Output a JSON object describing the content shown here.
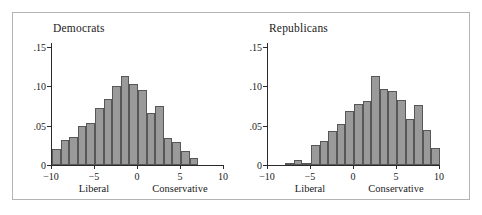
{
  "figure": {
    "background": "#ffffff",
    "frame_color": "#b4b4b4",
    "bar_fill": "#9a9a9a",
    "bar_edge": "#575757"
  },
  "chart_data": [
    {
      "type": "bar",
      "title": "Democrats",
      "xlabel": "",
      "ylabel": "",
      "xlim": [
        -10,
        10
      ],
      "ylim": [
        0,
        0.155
      ],
      "grid": false,
      "legend": "none",
      "xticks": [
        -10,
        -5,
        0,
        5,
        10
      ],
      "xtick_labels": [
        "−10",
        "−5",
        "0",
        "5",
        "10"
      ],
      "yticks": [
        0,
        0.05,
        0.1,
        0.15
      ],
      "ytick_labels": [
        "0",
        ".05",
        ".10",
        ".15"
      ],
      "annotations": [
        {
          "text": "Liberal",
          "x": -5
        },
        {
          "text": "Conservative",
          "x": 5
        }
      ],
      "bin_width": 1,
      "bin_centers": [
        -9.5,
        -8.5,
        -7.5,
        -6.5,
        -5.5,
        -4.5,
        -3.5,
        -2.5,
        -1.5,
        -0.5,
        0.5,
        1.5,
        2.5,
        3.5,
        4.5,
        5.5,
        6.5
      ],
      "values": [
        0.02,
        0.032,
        0.035,
        0.049,
        0.054,
        0.073,
        0.084,
        0.1,
        0.113,
        0.103,
        0.095,
        0.066,
        0.075,
        0.034,
        0.029,
        0.018,
        0.009,
        0.005
      ]
    },
    {
      "type": "bar",
      "title": "Republicans",
      "xlabel": "",
      "ylabel": "",
      "xlim": [
        -10,
        10
      ],
      "ylim": [
        0,
        0.155
      ],
      "grid": false,
      "legend": "none",
      "xticks": [
        -10,
        -5,
        0,
        5,
        10
      ],
      "xtick_labels": [
        "−10",
        "−5",
        "0",
        "5",
        "10"
      ],
      "yticks": [
        0,
        0.05,
        0.1,
        0.15
      ],
      "ytick_labels": [
        "0",
        ".05",
        ".10",
        ".15"
      ],
      "annotations": [
        {
          "text": "Liberal",
          "x": -5
        },
        {
          "text": "Conservative",
          "x": 5
        }
      ],
      "bin_width": 1,
      "bin_centers": [
        -7.5,
        -6.5,
        -5.5,
        -4.5,
        -3.5,
        -2.5,
        -1.5,
        -0.5,
        0.5,
        1.5,
        2.5,
        3.5,
        4.5,
        5.5,
        6.5,
        7.5,
        8.5,
        9.5
      ],
      "values": [
        0.002,
        0.006,
        0.002,
        0.025,
        0.03,
        0.043,
        0.052,
        0.069,
        0.078,
        0.081,
        0.113,
        0.097,
        0.094,
        0.082,
        0.058,
        0.076,
        0.045,
        0.022,
        0.007
      ]
    }
  ]
}
